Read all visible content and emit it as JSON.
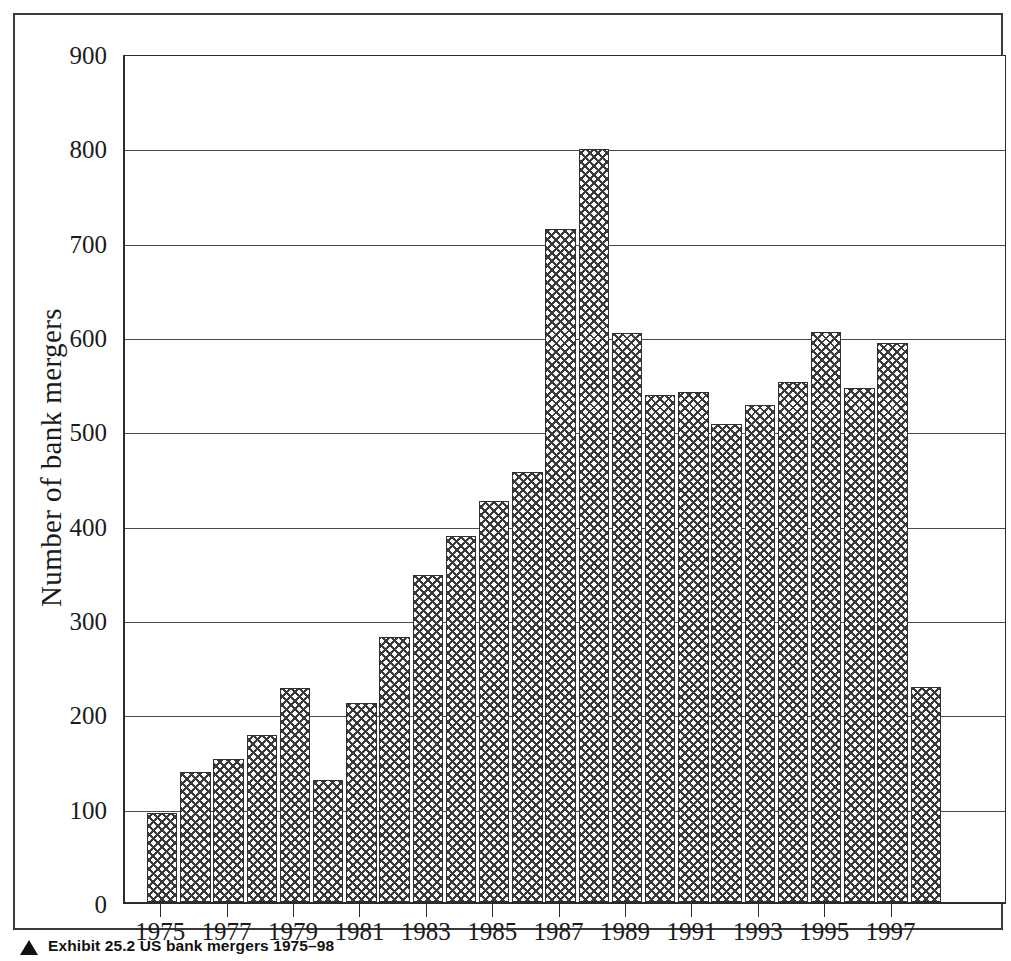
{
  "figure": {
    "caption_marker": "triangle-bullet",
    "caption_label": "Exhibit 25.2",
    "caption_title": "US bank mergers 1975–98"
  },
  "chart_data": {
    "type": "bar",
    "title": "",
    "xlabel": "",
    "ylabel": "Number of bank mergers",
    "ylim": [
      0,
      900
    ],
    "ytick_step": 100,
    "grid": true,
    "legend": "none",
    "yticks": [
      "0",
      "100",
      "200",
      "300",
      "400",
      "500",
      "600",
      "700",
      "800",
      "900"
    ],
    "xticks_visible": [
      "1975",
      "1977",
      "1979",
      "1981",
      "1983",
      "1985",
      "1987",
      "1989",
      "1991",
      "1993",
      "1995",
      "1997"
    ],
    "categories": [
      "1975",
      "1976",
      "1977",
      "1978",
      "1979",
      "1980",
      "1981",
      "1982",
      "1983",
      "1984",
      "1985",
      "1986",
      "1987",
      "1988",
      "1989",
      "1990",
      "1991",
      "1992",
      "1993",
      "1994",
      "1995",
      "1996",
      "1997",
      "1998"
    ],
    "values": [
      94,
      138,
      152,
      177,
      227,
      129,
      211,
      281,
      347,
      388,
      425,
      456,
      713,
      798,
      603,
      537,
      541,
      507,
      527,
      551,
      604,
      545,
      593,
      228
    ],
    "bar_style": {
      "fill": "crosshatch",
      "fill_color": "#fbfbfb",
      "hatch_color": "#3a3a3a",
      "edge_color": "#303030"
    }
  },
  "colors": {
    "frame": "#3a3a3a",
    "axis": "#2b2b2b",
    "gridline": "#4a4a4a",
    "text": "#1b1b1b",
    "background": "#ffffff"
  }
}
